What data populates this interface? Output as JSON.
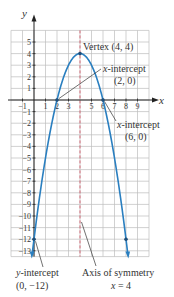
{
  "chart_data": {
    "type": "line",
    "title": "",
    "xlabel": "x",
    "ylabel": "y",
    "xlim": [
      -2,
      10
    ],
    "ylim": [
      -13.5,
      6
    ],
    "grid": true,
    "x_ticks": [
      -1,
      1,
      2,
      3,
      5,
      6,
      7,
      8,
      9
    ],
    "y_ticks": [
      5,
      4,
      3,
      2,
      1,
      -1,
      -2,
      -3,
      -4,
      -5,
      -6,
      -7,
      -8,
      -9,
      -10,
      -11,
      -12,
      -13
    ],
    "function": "y = -(x - 4)^2 + 4",
    "series": [
      {
        "name": "parabola",
        "x": [
          -0.1,
          0,
          1,
          2,
          3,
          4,
          5,
          6,
          7,
          8,
          8.1
        ],
        "y": [
          -12.81,
          -12,
          -5,
          0,
          3,
          4,
          3,
          0,
          -5,
          -12,
          -12.81
        ]
      }
    ],
    "axis_of_symmetry": 4,
    "points": [
      {
        "x": 4,
        "y": 4,
        "label": "Vertex (4, 4)"
      },
      {
        "x": 2,
        "y": 0,
        "label": "x-intercept (2, 0)"
      },
      {
        "x": 6,
        "y": 0,
        "label": "x-intercept (6, 0)"
      },
      {
        "x": 0,
        "y": -12,
        "label": "y-intercept (0, −12)"
      },
      {
        "x": 8,
        "y": -12,
        "label": ""
      }
    ],
    "annotations": [
      {
        "line1": "Vertex (4, 4)"
      },
      {
        "line1": "x-intercept",
        "line2": "(2, 0)"
      },
      {
        "line1": "x-intercept",
        "line2": "(6, 0)"
      },
      {
        "line1": "y-intercept",
        "line2": "(0, −12)"
      },
      {
        "line1": "Axis of symmetry",
        "line2": "x = 4"
      }
    ]
  },
  "labels": {
    "y_axis": "y",
    "x_axis": "x",
    "vertex": "Vertex (4, 4)",
    "xint1_l1": "-intercept",
    "xint1_var": "x",
    "xint1_l2": "(2, 0)",
    "xint2_l1": "-intercept",
    "xint2_var": "x",
    "xint2_l2": "(6, 0)",
    "yint_var": "y",
    "yint_l1": "-intercept",
    "yint_l2": "(0, −12)",
    "axis_l1": "Axis of symmetry",
    "axis_var": "x",
    "axis_l2": " = 4"
  },
  "colors": {
    "curve": "#2a7fc0",
    "axis_of_symmetry": "#d04a5a",
    "grid": "#bdbdbd",
    "axes": "#222222"
  }
}
